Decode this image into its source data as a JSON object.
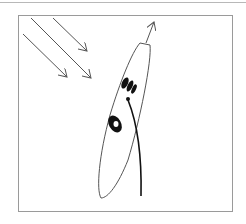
{
  "diagram": {
    "elements": {
      "light_rays": {
        "count": 3,
        "direction": "down-right",
        "color": "#555555"
      },
      "cell_body": {
        "shape": "elongated-ellipse",
        "stroke": "#555555"
      },
      "flagellum": {
        "color": "#111111"
      },
      "eyespot": {
        "color": "#111111"
      },
      "nucleus": {
        "color": "#111111"
      },
      "swim_direction_arrow": {
        "direction": "up",
        "color": "#555555"
      }
    },
    "frame": {
      "border_color": "#9a9a9a"
    },
    "labels": []
  }
}
